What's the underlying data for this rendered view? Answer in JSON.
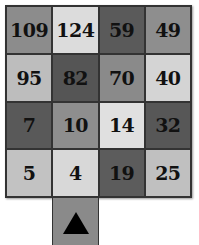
{
  "puzzle": {
    "grid": [
      [
        {
          "value": "109",
          "shade": "#8c8c8c"
        },
        {
          "value": "124",
          "shade": "#dcdcdc"
        },
        {
          "value": "59",
          "shade": "#5a5a5a"
        },
        {
          "value": "49",
          "shade": "#8e8e8e"
        }
      ],
      [
        {
          "value": "95",
          "shade": "#bdbdbd"
        },
        {
          "value": "82",
          "shade": "#555555"
        },
        {
          "value": "70",
          "shade": "#8a8a8a"
        },
        {
          "value": "40",
          "shade": "#d4d4d4"
        }
      ],
      [
        {
          "value": "7",
          "shade": "#595959"
        },
        {
          "value": "10",
          "shade": "#8e8e8e"
        },
        {
          "value": "14",
          "shade": "#e0e0e0"
        },
        {
          "value": "32",
          "shade": "#575757"
        }
      ],
      [
        {
          "value": "5",
          "shade": "#c2c2c2"
        },
        {
          "value": "4",
          "shade": "#d8d8d8"
        },
        {
          "value": "19",
          "shade": "#5c5c5c"
        },
        {
          "value": "25",
          "shade": "#c0c0c0"
        }
      ]
    ],
    "start_tile": {
      "icon": "up-triangle-icon",
      "shade": "#8a8a8a"
    }
  }
}
